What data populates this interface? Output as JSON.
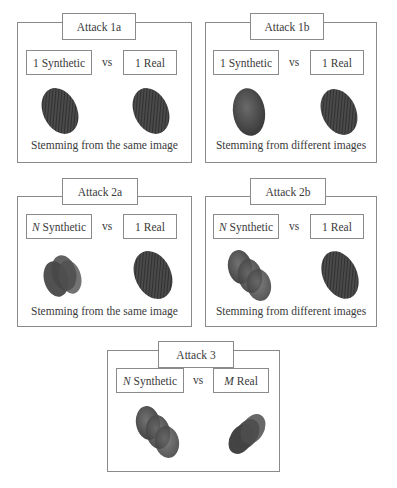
{
  "panels": [
    {
      "id": "attack-1a",
      "title": "Attack 1a",
      "left_label": {
        "prefix": "1",
        "prefix_italic": false,
        "text": "Synthetic"
      },
      "vs": "vs",
      "right_label": {
        "prefix": "1",
        "prefix_italic": false,
        "text": "Real"
      },
      "left_image": "single-synthetic-fingerprint",
      "right_image": "single-real-fingerprint",
      "caption": "Stemming from the same image"
    },
    {
      "id": "attack-1b",
      "title": "Attack 1b",
      "left_label": {
        "prefix": "1",
        "prefix_italic": false,
        "text": "Synthetic"
      },
      "vs": "vs",
      "right_label": {
        "prefix": "1",
        "prefix_italic": false,
        "text": "Real"
      },
      "left_image": "single-synthetic-fingerprint",
      "right_image": "single-real-fingerprint",
      "caption": "Stemming from different images"
    },
    {
      "id": "attack-2a",
      "title": "Attack 2a",
      "left_label": {
        "prefix": "N",
        "prefix_italic": true,
        "text": "Synthetic"
      },
      "vs": "vs",
      "right_label": {
        "prefix": "1",
        "prefix_italic": false,
        "text": "Real"
      },
      "left_image": "stacked-synthetic-fingerprints",
      "right_image": "single-real-fingerprint",
      "caption": "Stemming from the same image"
    },
    {
      "id": "attack-2b",
      "title": "Attack 2b",
      "left_label": {
        "prefix": "N",
        "prefix_italic": true,
        "text": "Synthetic"
      },
      "vs": "vs",
      "right_label": {
        "prefix": "1",
        "prefix_italic": false,
        "text": "Real"
      },
      "left_image": "stacked-synthetic-fingerprints",
      "right_image": "single-real-fingerprint",
      "caption": "Stemming from different images"
    },
    {
      "id": "attack-3",
      "title": "Attack 3",
      "left_label": {
        "prefix": "N",
        "prefix_italic": true,
        "text": "Synthetic"
      },
      "vs": "vs",
      "right_label": {
        "prefix": "M",
        "prefix_italic": true,
        "text": "Real"
      },
      "left_image": "stacked-synthetic-fingerprints",
      "right_image": "stacked-real-fingerprints",
      "caption": ""
    }
  ],
  "colors": {
    "border": "#8a8a8a",
    "text": "#3a3a3a",
    "fingerprint_dark": "#2e2e2e",
    "fingerprint_mid": "#5a5a5a"
  }
}
